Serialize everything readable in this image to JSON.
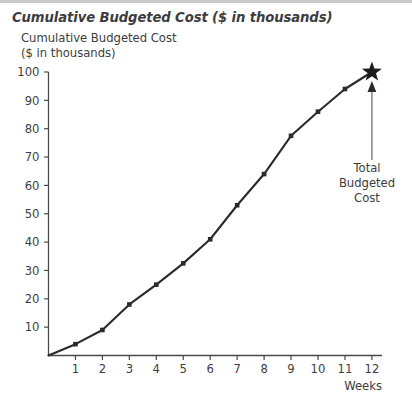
{
  "figure": {
    "title": "Cumulative Budgeted Cost ($ in thousands)",
    "y_axis_title_line1": "Cumulative Budgeted Cost",
    "y_axis_title_line2": "($ in thousands)",
    "x_axis_title": "Weeks"
  },
  "annotation": {
    "line1": "Total",
    "line2": "Budgeted",
    "line3": "Cost",
    "marker": "star-marker"
  },
  "colors": {
    "line": "#2b2b2b",
    "axis": "#4a4a4a",
    "text": "#3d3d3d",
    "annotation_leader": "#8c8c8c",
    "top_band": "#c9c9c9",
    "background": "#ffffff"
  },
  "chart_data": {
    "type": "line",
    "title": "Cumulative Budgeted Cost ($ in thousands)",
    "xlabel": "Weeks",
    "ylabel": "Cumulative Budgeted Cost ($ in thousands)",
    "x": [
      0,
      1,
      2,
      3,
      4,
      5,
      6,
      7,
      8,
      9,
      10,
      11,
      12
    ],
    "y": [
      0,
      4,
      9,
      18,
      25,
      32.5,
      41,
      53,
      64,
      77.5,
      86,
      94,
      100
    ],
    "xtick_labels": [
      "1",
      "2",
      "3",
      "4",
      "5",
      "6",
      "7",
      "8",
      "9",
      "10",
      "11",
      "12"
    ],
    "xtick_values": [
      1,
      2,
      3,
      4,
      5,
      6,
      7,
      8,
      9,
      10,
      11,
      12
    ],
    "ytick_labels": [
      "10",
      "20",
      "30",
      "40",
      "50",
      "60",
      "70",
      "80",
      "90",
      "100"
    ],
    "ytick_values": [
      10,
      20,
      30,
      40,
      50,
      60,
      70,
      80,
      90,
      100
    ],
    "xlim": [
      0,
      12.6
    ],
    "ylim": [
      0,
      101
    ],
    "grid": false,
    "legend": false,
    "marker": "square",
    "series": [
      {
        "name": "Cumulative Budgeted Cost",
        "values": [
          0,
          4,
          9,
          18,
          25,
          32.5,
          41,
          53,
          64,
          77.5,
          86,
          94,
          100
        ]
      }
    ],
    "annotations": [
      {
        "text": "Total Budgeted Cost",
        "x": 12,
        "y": 100,
        "marker": "star"
      }
    ]
  }
}
